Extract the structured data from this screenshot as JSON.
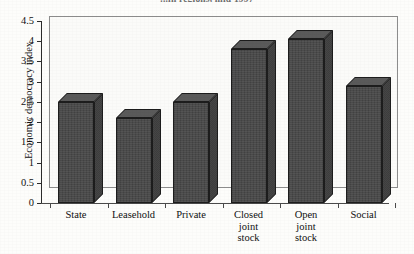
{
  "chart_data": {
    "type": "bar",
    "title": "...in regions, mid 1997",
    "xlabel": "",
    "ylabel": "Economic democracy index",
    "categories": [
      "State",
      "Leasehold",
      "Private",
      "Closed\njoint\nstock",
      "Open\njoint\nstock",
      "Social"
    ],
    "values": [
      2.5,
      2.1,
      2.5,
      3.8,
      4.05,
      2.9
    ],
    "ylim": [
      0,
      4.5
    ],
    "ytick_labels": [
      "0",
      "0.5",
      "1",
      "1.5",
      "2",
      "2.5",
      "3",
      "3.5",
      "4",
      "4.5"
    ],
    "ytick_values": [
      0,
      0.5,
      1,
      1.5,
      2,
      2.5,
      3,
      3.5,
      4,
      4.5
    ],
    "grid": false,
    "legend": "none",
    "style": "3d-column",
    "bar_color": "#4b4b4b",
    "bar_side_color": "#3e3e3e",
    "bar_top_color": "#5a5a5a",
    "frame_color": "#8d8d8d",
    "axis_color": "#2b2b2b",
    "background": "#fdfdfb"
  }
}
